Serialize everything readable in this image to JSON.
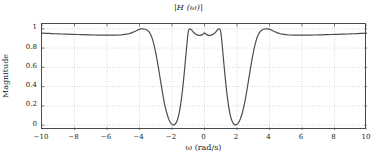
{
  "chart_data": {
    "type": "line",
    "title": "|H (ω)|",
    "xlabel": "ω (rad/s)",
    "ylabel": "Magnitude",
    "xlim": [
      -10,
      10
    ],
    "ylim": [
      -0.05,
      1.05
    ],
    "xticks": [
      -10,
      -8,
      -6,
      -4,
      -2,
      0,
      2,
      4,
      6,
      8,
      10
    ],
    "xtick_labels": [
      "−10",
      "−8",
      "−6",
      "−4",
      "−2",
      "0",
      "2",
      "4",
      "6",
      "8",
      "10"
    ],
    "yticks": [
      0,
      0.2,
      0.4,
      0.6,
      0.8,
      1
    ],
    "ytick_labels": [
      "0",
      "0.2",
      "0.4",
      "0.6",
      "0.8",
      "1"
    ],
    "grid": true,
    "grid_style": "dotted",
    "legend": null,
    "line_color": "#4d4d4d",
    "line_width": 1.2,
    "grid_color": "#9a9aa8",
    "frame_color": "#4a4a4a",
    "series": [
      {
        "name": "|H(ω)|",
        "x": [
          -10.0,
          -9.6,
          -9.2,
          -8.8,
          -8.4,
          -8.0,
          -7.6,
          -7.2,
          -6.8,
          -6.4,
          -6.0,
          -5.6,
          -5.2,
          -4.8,
          -4.6,
          -4.4,
          -4.2,
          -4.05,
          -3.9,
          -3.8,
          -3.7,
          -3.6,
          -3.5,
          -3.4,
          -3.3,
          -3.2,
          -3.1,
          -3.0,
          -2.9,
          -2.8,
          -2.7,
          -2.6,
          -2.5,
          -2.4,
          -2.3,
          -2.2,
          -2.1,
          -2.0,
          -1.9,
          -1.8,
          -1.7,
          -1.6,
          -1.5,
          -1.4,
          -1.35,
          -1.3,
          -1.25,
          -1.2,
          -1.15,
          -1.1,
          -1.05,
          -1.0,
          -0.95,
          -0.9,
          -0.85,
          -0.8,
          -0.7,
          -0.6,
          -0.5,
          -0.4,
          -0.3,
          -0.2,
          -0.1,
          0.0,
          0.1,
          0.2,
          0.3,
          0.4,
          0.5,
          0.6,
          0.7,
          0.8,
          0.85,
          0.9,
          0.95,
          1.0,
          1.05,
          1.1,
          1.15,
          1.2,
          1.25,
          1.3,
          1.35,
          1.4,
          1.5,
          1.6,
          1.7,
          1.8,
          1.9,
          2.0,
          2.1,
          2.2,
          2.3,
          2.4,
          2.5,
          2.6,
          2.7,
          2.8,
          2.9,
          3.0,
          3.1,
          3.2,
          3.3,
          3.4,
          3.5,
          3.6,
          3.7,
          3.8,
          3.9,
          4.05,
          4.2,
          4.4,
          4.6,
          4.8,
          5.2,
          5.6,
          6.0,
          6.4,
          6.8,
          7.2,
          7.6,
          8.0,
          8.4,
          8.8,
          9.2,
          9.6,
          10.0
        ],
        "y": [
          0.955,
          0.952,
          0.949,
          0.946,
          0.944,
          0.942,
          0.94,
          0.938,
          0.936,
          0.935,
          0.934,
          0.934,
          0.936,
          0.944,
          0.952,
          0.965,
          0.98,
          0.992,
          0.999,
          1.0,
          0.998,
          0.993,
          0.983,
          0.965,
          0.935,
          0.89,
          0.828,
          0.75,
          0.66,
          0.56,
          0.455,
          0.352,
          0.258,
          0.178,
          0.113,
          0.063,
          0.028,
          0.009,
          0.004,
          0.012,
          0.04,
          0.095,
          0.18,
          0.3,
          0.372,
          0.45,
          0.535,
          0.625,
          0.718,
          0.81,
          0.9,
          0.968,
          0.995,
          1.0,
          0.996,
          0.988,
          0.968,
          0.952,
          0.941,
          0.934,
          0.931,
          0.934,
          0.944,
          0.958,
          0.944,
          0.934,
          0.931,
          0.934,
          0.941,
          0.952,
          0.968,
          0.988,
          0.996,
          1.0,
          0.995,
          0.968,
          0.9,
          0.81,
          0.718,
          0.625,
          0.535,
          0.45,
          0.372,
          0.3,
          0.18,
          0.095,
          0.04,
          0.012,
          0.004,
          0.009,
          0.028,
          0.063,
          0.113,
          0.178,
          0.258,
          0.352,
          0.455,
          0.56,
          0.66,
          0.75,
          0.828,
          0.89,
          0.935,
          0.965,
          0.983,
          0.993,
          0.998,
          1.0,
          0.999,
          0.992,
          0.98,
          0.965,
          0.952,
          0.944,
          0.936,
          0.934,
          0.934,
          0.935,
          0.936,
          0.938,
          0.94,
          0.942,
          0.944,
          0.946,
          0.949,
          0.952,
          0.955
        ]
      }
    ]
  }
}
